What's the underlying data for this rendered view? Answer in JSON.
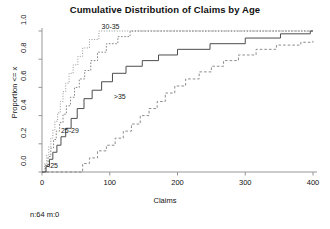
{
  "chart_data": {
    "type": "line",
    "title": "Cumulative Distribution of Claims by Age",
    "xlabel": "Claims",
    "ylabel": "Proportion <= x",
    "xlim": [
      0,
      400
    ],
    "ylim": [
      0.0,
      1.0
    ],
    "xticks": [
      0,
      100,
      200,
      300,
      400
    ],
    "xtick_labels": [
      "0",
      "100",
      "200",
      "300",
      "400"
    ],
    "yticks": [
      0.0,
      0.2,
      0.4,
      0.6,
      0.8,
      1.0
    ],
    "ytick_labels": [
      "0.0",
      "0.2",
      "0.4",
      "0.6",
      "0.8",
      "1.0"
    ],
    "grid": false,
    "legend": "inline-annotations",
    "footnote": "n:64 m:0",
    "annotations": [
      {
        "text": "<25",
        "x": 6,
        "y": 0.035
      },
      {
        "text": "25-29",
        "x": 28,
        "y": 0.285
      },
      {
        "text": "30-35",
        "x": 88,
        "y": 1.02
      },
      {
        "text": ">35",
        "x": 106,
        "y": 0.525
      }
    ],
    "series": [
      {
        "name": "<25",
        "style": "dotted",
        "color": "#8a8a8a",
        "points": [
          [
            0,
            0.0
          ],
          [
            4,
            0.06
          ],
          [
            7,
            0.12
          ],
          [
            10,
            0.18
          ],
          [
            13,
            0.24
          ],
          [
            16,
            0.3
          ],
          [
            19,
            0.36
          ],
          [
            23,
            0.42
          ],
          [
            27,
            0.5
          ],
          [
            31,
            0.57
          ],
          [
            35,
            0.63
          ],
          [
            40,
            0.7
          ],
          [
            46,
            0.76
          ],
          [
            53,
            0.82
          ],
          [
            60,
            0.88
          ],
          [
            70,
            0.94
          ],
          [
            84,
            1.0
          ],
          [
            400,
            1.0
          ]
        ]
      },
      {
        "name": "25-29",
        "style": "dashed-fine",
        "color": "#777777",
        "points": [
          [
            0,
            0.0
          ],
          [
            5,
            0.05
          ],
          [
            9,
            0.11
          ],
          [
            13,
            0.17
          ],
          [
            17,
            0.23
          ],
          [
            21,
            0.29
          ],
          [
            26,
            0.35
          ],
          [
            31,
            0.41
          ],
          [
            36,
            0.47
          ],
          [
            42,
            0.53
          ],
          [
            48,
            0.6
          ],
          [
            55,
            0.66
          ],
          [
            63,
            0.72
          ],
          [
            72,
            0.79
          ],
          [
            82,
            0.85
          ],
          [
            95,
            0.91
          ],
          [
            112,
            0.96
          ],
          [
            130,
            1.0
          ],
          [
            400,
            1.0
          ]
        ]
      },
      {
        "name": "30-35",
        "style": "solid",
        "color": "#4d4d4d",
        "points": [
          [
            0,
            0.0
          ],
          [
            6,
            0.04
          ],
          [
            11,
            0.09
          ],
          [
            16,
            0.14
          ],
          [
            22,
            0.19
          ],
          [
            28,
            0.25
          ],
          [
            35,
            0.31
          ],
          [
            43,
            0.38
          ],
          [
            52,
            0.45
          ],
          [
            62,
            0.52
          ],
          [
            74,
            0.58
          ],
          [
            88,
            0.64
          ],
          [
            104,
            0.7
          ],
          [
            124,
            0.75
          ],
          [
            148,
            0.79
          ],
          [
            172,
            0.83
          ],
          [
            200,
            0.87
          ],
          [
            248,
            0.91
          ],
          [
            300,
            0.95
          ],
          [
            352,
            0.98
          ],
          [
            396,
            1.0
          ],
          [
            400,
            1.0
          ]
        ]
      },
      {
        "name": ">35",
        "style": "dashed",
        "color": "#808080",
        "points": [
          [
            0,
            0.0
          ],
          [
            58,
            0.0
          ],
          [
            60,
            0.06
          ],
          [
            70,
            0.1
          ],
          [
            82,
            0.15
          ],
          [
            95,
            0.19
          ],
          [
            108,
            0.24
          ],
          [
            120,
            0.29
          ],
          [
            132,
            0.34
          ],
          [
            145,
            0.4
          ],
          [
            158,
            0.45
          ],
          [
            170,
            0.5
          ],
          [
            182,
            0.56
          ],
          [
            196,
            0.61
          ],
          [
            212,
            0.66
          ],
          [
            232,
            0.71
          ],
          [
            250,
            0.75
          ],
          [
            268,
            0.79
          ],
          [
            290,
            0.83
          ],
          [
            316,
            0.87
          ],
          [
            346,
            0.9
          ],
          [
            382,
            0.92
          ],
          [
            400,
            0.93
          ]
        ]
      }
    ]
  }
}
